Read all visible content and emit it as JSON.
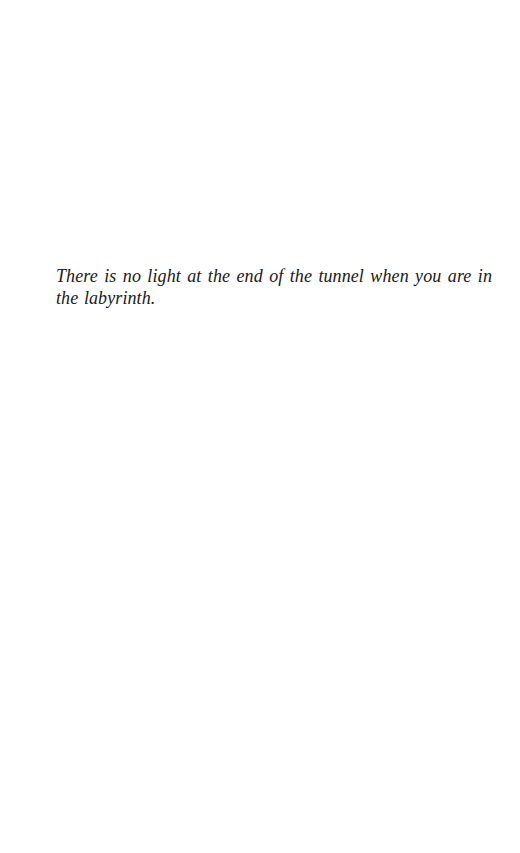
{
  "page": {
    "epigraph": {
      "text": "There is no light at the end of the tunnel when you are in the labyrinth."
    }
  }
}
